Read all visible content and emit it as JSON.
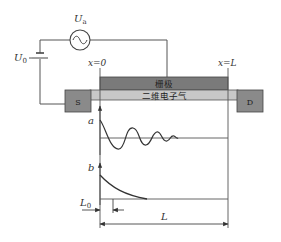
{
  "circuit": {
    "ac_source_label": "U",
    "ac_source_sub": "a",
    "dc_source_label": "U",
    "dc_source_sub": "0"
  },
  "device": {
    "gate_label": "栅极",
    "channel_label": "二维电子气",
    "source_label": "S",
    "drain_label": "D",
    "x0_label": "x=0",
    "xL_label": "x=L"
  },
  "plots": {
    "a_label": "a",
    "b_label": "b"
  },
  "dimensions": {
    "L0_label": "L",
    "L0_sub": "0",
    "L_label": "L"
  },
  "colors": {
    "gate": "#7a7a7a",
    "channel": "#c8c8c8",
    "contact": "#8a8a8a",
    "line": "#444444"
  }
}
